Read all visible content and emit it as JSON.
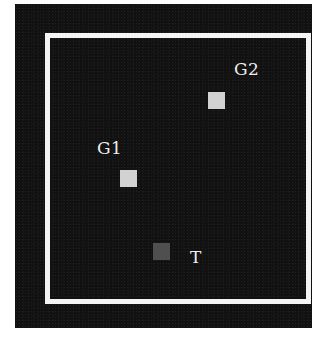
{
  "display": {
    "background_color": "#111111",
    "frame_color": "#f4f4f4"
  },
  "stimuli": [
    {
      "id": "G1",
      "label": "G1",
      "type": "goal",
      "color": "#d2d2d2"
    },
    {
      "id": "G2",
      "label": "G2",
      "type": "goal",
      "color": "#d2d2d2"
    },
    {
      "id": "T",
      "label": "T",
      "type": "target",
      "color": "#4f4f4f"
    }
  ],
  "labels": {
    "g1": "G1",
    "g2": "G2",
    "t": "T"
  }
}
